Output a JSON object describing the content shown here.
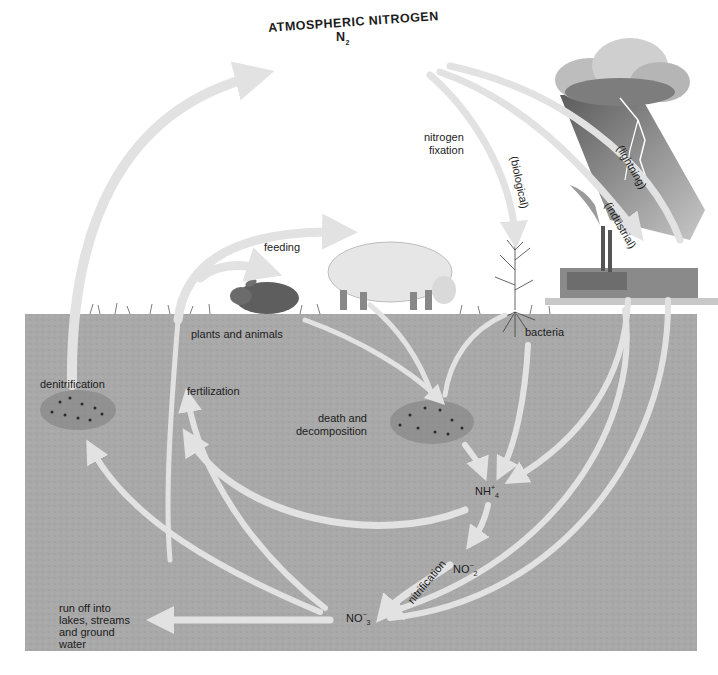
{
  "diagram": {
    "title": "ATMOSPHERIC NITROGEN",
    "title_formula": "N",
    "title_formula_sub": "2",
    "labels": {
      "nitrogen_fixation": [
        "nitrogen",
        "fixation"
      ],
      "biological": "(biological)",
      "lightning": "(lightning)",
      "industrial": "(industrial)",
      "feeding": "feeding",
      "plants_and_animals": "plants and animals",
      "bacteria": "bacteria",
      "denitrification": "denitrification",
      "fertilization": "fertilization",
      "death_and_decomposition": [
        "death and",
        "decomposition"
      ],
      "nitrification": "nitrification",
      "run_off": [
        "run off into",
        "lakes, streams",
        "and ground",
        "water"
      ]
    },
    "compounds": {
      "ammonium": {
        "base": "NH",
        "sup": "+",
        "sub": "4"
      },
      "nitrite": {
        "base": "NO",
        "sup": "−",
        "sub": "2"
      },
      "nitrate": {
        "base": "NO",
        "sup": "−",
        "sub": "3"
      }
    },
    "colors": {
      "sky": "#ffffff",
      "soil": "#a9a9a9",
      "arrow": "#e2e2e2",
      "cloud": "#9a9a9a",
      "rain": "#6e6e6e",
      "text": "#1c1c1c"
    },
    "icons": [
      "storm-cloud-icon",
      "lightning-icon",
      "factory-icon",
      "rabbit-icon",
      "sheep-icon",
      "plant-icon",
      "bacteria-cluster-icon",
      "decomposition-cluster-icon",
      "denitrification-cluster-icon"
    ]
  }
}
